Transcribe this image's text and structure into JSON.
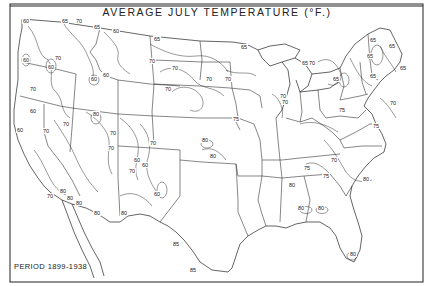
{
  "map": {
    "title": "AVERAGE JULY TEMPERATURE (°F.)",
    "period_label": "PERIOD 1899-1938",
    "colors": {
      "background": "#ffffff",
      "ink": "#222222"
    },
    "isotherm_labels": [
      {
        "text": "60",
        "x": 26,
        "y": 23
      },
      {
        "text": "65",
        "x": 65,
        "y": 23
      },
      {
        "text": "70",
        "x": 79,
        "y": 23
      },
      {
        "text": "65",
        "x": 97,
        "y": 29
      },
      {
        "text": "60",
        "x": 116,
        "y": 33
      },
      {
        "text": "70",
        "x": 58,
        "y": 60
      },
      {
        "text": "60",
        "x": 26,
        "y": 62
      },
      {
        "text": "60",
        "x": 51,
        "y": 69
      },
      {
        "text": "60",
        "x": 94,
        "y": 81
      },
      {
        "text": "60",
        "x": 106,
        "y": 77
      },
      {
        "text": "65",
        "x": 157,
        "y": 41
      },
      {
        "text": "70",
        "x": 152,
        "y": 63
      },
      {
        "text": "70",
        "x": 168,
        "y": 91
      },
      {
        "text": "70",
        "x": 209,
        "y": 81
      },
      {
        "text": "70",
        "x": 175,
        "y": 70
      },
      {
        "text": "70",
        "x": 228,
        "y": 81
      },
      {
        "text": "65",
        "x": 244,
        "y": 49
      },
      {
        "text": "70",
        "x": 283,
        "y": 98
      },
      {
        "text": "70",
        "x": 285,
        "y": 104
      },
      {
        "text": "75",
        "x": 236,
        "y": 121
      },
      {
        "text": "65",
        "x": 305,
        "y": 65
      },
      {
        "text": "70",
        "x": 312,
        "y": 65
      },
      {
        "text": "65",
        "x": 370,
        "y": 58
      },
      {
        "text": "65",
        "x": 373,
        "y": 42
      },
      {
        "text": "65",
        "x": 392,
        "y": 48
      },
      {
        "text": "65",
        "x": 373,
        "y": 78
      },
      {
        "text": "65",
        "x": 336,
        "y": 81
      },
      {
        "text": "65",
        "x": 403,
        "y": 70
      },
      {
        "text": "70",
        "x": 393,
        "y": 105
      },
      {
        "text": "75",
        "x": 342,
        "y": 112
      },
      {
        "text": "75",
        "x": 376,
        "y": 128
      },
      {
        "text": "70",
        "x": 33,
        "y": 91
      },
      {
        "text": "60",
        "x": 33,
        "y": 113
      },
      {
        "text": "70",
        "x": 46,
        "y": 133
      },
      {
        "text": "80",
        "x": 96,
        "y": 116
      },
      {
        "text": "70",
        "x": 66,
        "y": 126
      },
      {
        "text": "60",
        "x": 20,
        "y": 132
      },
      {
        "text": "70",
        "x": 113,
        "y": 135
      },
      {
        "text": "70",
        "x": 111,
        "y": 150
      },
      {
        "text": "60",
        "x": 137,
        "y": 162
      },
      {
        "text": "70",
        "x": 132,
        "y": 173
      },
      {
        "text": "70",
        "x": 153,
        "y": 145
      },
      {
        "text": "60",
        "x": 145,
        "y": 167
      },
      {
        "text": "80",
        "x": 205,
        "y": 142
      },
      {
        "text": "80",
        "x": 213,
        "y": 158
      },
      {
        "text": "60",
        "x": 157,
        "y": 196
      },
      {
        "text": "70",
        "x": 50,
        "y": 198
      },
      {
        "text": "80",
        "x": 63,
        "y": 193
      },
      {
        "text": "80",
        "x": 70,
        "y": 200
      },
      {
        "text": "80",
        "x": 79,
        "y": 205
      },
      {
        "text": "80",
        "x": 97,
        "y": 215
      },
      {
        "text": "80",
        "x": 124,
        "y": 215
      },
      {
        "text": "85",
        "x": 176,
        "y": 246
      },
      {
        "text": "85",
        "x": 193,
        "y": 272
      },
      {
        "text": "75",
        "x": 307,
        "y": 170
      },
      {
        "text": "70",
        "x": 334,
        "y": 162
      },
      {
        "text": "75",
        "x": 326,
        "y": 178
      },
      {
        "text": "80",
        "x": 366,
        "y": 181
      },
      {
        "text": "80",
        "x": 292,
        "y": 187
      },
      {
        "text": "80",
        "x": 301,
        "y": 210
      },
      {
        "text": "80",
        "x": 321,
        "y": 210
      },
      {
        "text": "80",
        "x": 353,
        "y": 256
      }
    ]
  }
}
